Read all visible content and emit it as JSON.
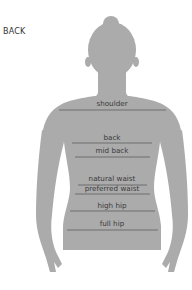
{
  "view_label": "BACK",
  "colors": {
    "silhouette": "#ababab",
    "line": "#6f6f6f",
    "label": "#3a3a3a"
  },
  "measurements": [
    {
      "label": "shoulder",
      "y": 110
    },
    {
      "label": "back",
      "y": 143
    },
    {
      "label": "mid back",
      "y": 157
    },
    {
      "label": "natural waist",
      "y": 185
    },
    {
      "label": "preferred waist",
      "y": 194
    },
    {
      "label": "high hip",
      "y": 211
    },
    {
      "label": "full hip",
      "y": 230
    }
  ]
}
